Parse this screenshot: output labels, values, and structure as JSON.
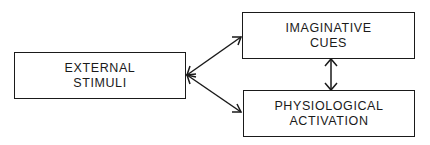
{
  "diagram": {
    "nodes": [
      {
        "id": "external",
        "lines": [
          "EXTERNAL",
          "STIMULI"
        ]
      },
      {
        "id": "imaginative",
        "lines": [
          "IMAGINATIVE",
          "CUES"
        ]
      },
      {
        "id": "physiological",
        "lines": [
          "PHYSIOLOGICAL",
          "ACTIVATION"
        ]
      }
    ],
    "edges": [
      {
        "from": "external",
        "to": "imaginative",
        "direction": "bidirectional"
      },
      {
        "from": "external",
        "to": "physiological",
        "direction": "bidirectional"
      },
      {
        "from": "imaginative",
        "to": "physiological",
        "direction": "bidirectional"
      }
    ],
    "colors": {
      "stroke": "#1a1a1a",
      "background": "#ffffff"
    }
  }
}
